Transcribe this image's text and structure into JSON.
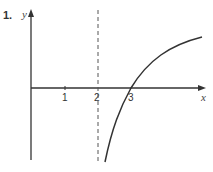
{
  "question": {
    "number": "1."
  },
  "graph": {
    "x_axis_label": "x",
    "y_axis_label": "y",
    "ticks": [
      "1",
      "2",
      "3"
    ],
    "asymptote": "x = 2 (dashed vertical)",
    "curve": "logarithmic-type curve with vertical asymptote at x=2, crossing x-axis at x=3"
  }
}
